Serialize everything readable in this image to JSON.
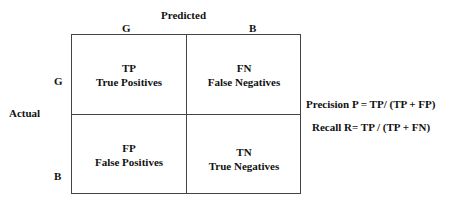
{
  "diagram": {
    "title_predicted": "Predicted",
    "title_actual": "Actual",
    "col_labels": [
      "G",
      "B"
    ],
    "row_labels": [
      "G",
      "B"
    ],
    "cells": [
      {
        "abbr": "TP",
        "name": "True Positives"
      },
      {
        "abbr": "FN",
        "name": "False Negatives"
      },
      {
        "abbr": "FP",
        "name": "False Positives"
      },
      {
        "abbr": "TN",
        "name": "True Negatives"
      }
    ],
    "formulas": {
      "precision": "Precision P = TP/ (TP + FP)",
      "recall": "Recall R= TP / (TP + FN)"
    }
  }
}
